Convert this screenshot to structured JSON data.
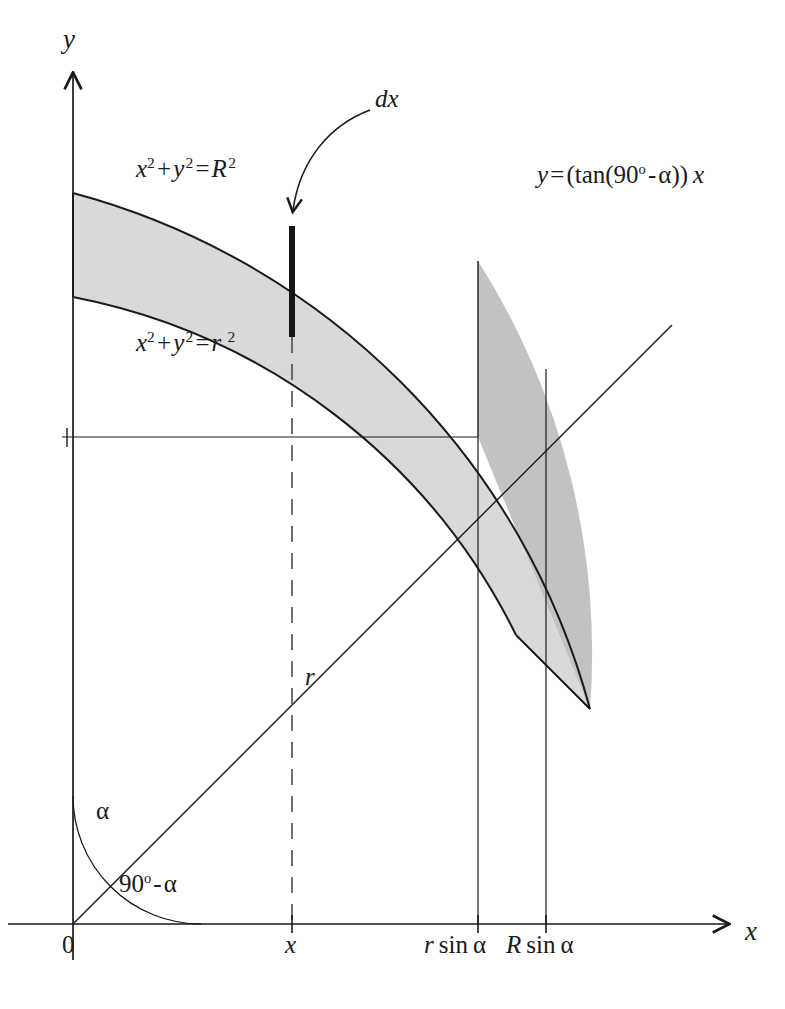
{
  "figure": {
    "type": "geometry-diagram",
    "axes": {
      "y_label": "y",
      "x_label": "x",
      "origin_label": "0"
    },
    "curves": {
      "outer_circle_equation": "x² + y² = R²",
      "inner_circle_equation": "x² + y² = r²",
      "line_equation": "y = (tan(90° - α)) x"
    },
    "annotations": {
      "strip_label": "dx",
      "radius_label": "r",
      "angle_from_y_axis": "α",
      "angle_from_x_axis": "90° - α"
    },
    "x_ticks": [
      {
        "label": "x",
        "value": "x"
      },
      {
        "label": "r sin α",
        "value": "r sin α"
      },
      {
        "label": "R sin α",
        "value": "R sin α"
      }
    ],
    "colors": {
      "stroke": "#1a1a1a",
      "light_shade": "#d9d9d9",
      "dark_shade": "#c2c2c2",
      "background": "#ffffff"
    },
    "geometry": {
      "origin_px": [
        73,
        924
      ],
      "outer_radius_px": 731,
      "inner_radius_px": 627,
      "ray_angle_deg_from_x_axis": 45,
      "strip_x_px": 292,
      "r_sin_alpha_px": 478,
      "R_sin_alpha_px": 546
    }
  }
}
